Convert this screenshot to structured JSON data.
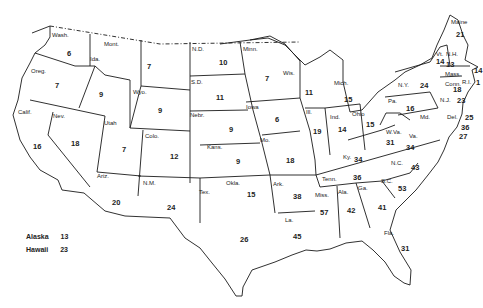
{
  "map": {
    "states": [
      {
        "abbr": "Wash.",
        "value": "6",
        "lx": 52,
        "ly": 32,
        "vx": 67,
        "vy": 50
      },
      {
        "abbr": "Oreg.",
        "value": "7",
        "lx": 31,
        "ly": 68,
        "vx": 55,
        "vy": 82
      },
      {
        "abbr": "Calif.",
        "value": "16",
        "lx": 18,
        "ly": 109,
        "vx": 33,
        "vy": 143
      },
      {
        "abbr": "Ida.",
        "value": "9",
        "lx": 90,
        "ly": 56,
        "vx": 99,
        "vy": 91
      },
      {
        "abbr": "Nev.",
        "value": "18",
        "lx": 53,
        "ly": 113,
        "vx": 71,
        "vy": 140
      },
      {
        "abbr": "Mont.",
        "value": "7",
        "lx": 104,
        "ly": 41,
        "vx": 147,
        "vy": 63
      },
      {
        "abbr": "Wyo.",
        "value": "9",
        "lx": 133,
        "ly": 89,
        "vx": 158,
        "vy": 107
      },
      {
        "abbr": "Utah",
        "value": "7",
        "lx": 104,
        "ly": 120,
        "vx": 122,
        "vy": 146
      },
      {
        "abbr": "Colo.",
        "value": "12",
        "lx": 145,
        "ly": 133,
        "vx": 170,
        "vy": 153
      },
      {
        "abbr": "Ariz.",
        "value": "20",
        "lx": 97,
        "ly": 173,
        "vx": 112,
        "vy": 199
      },
      {
        "abbr": "N.M.",
        "value": "24",
        "lx": 143,
        "ly": 180,
        "vx": 167,
        "vy": 204
      },
      {
        "abbr": "N.D.",
        "value": "10",
        "lx": 192,
        "ly": 46,
        "vx": 219,
        "vy": 59
      },
      {
        "abbr": "S.D.",
        "value": "11",
        "lx": 191,
        "ly": 79,
        "vx": 216,
        "vy": 94
      },
      {
        "abbr": "Nebr.",
        "value": "9",
        "lx": 190,
        "ly": 112,
        "vx": 229,
        "vy": 126
      },
      {
        "abbr": "Kans.",
        "value": "9",
        "lx": 207,
        "ly": 144,
        "vx": 236,
        "vy": 158
      },
      {
        "abbr": "Okla.",
        "value": "15",
        "lx": 226,
        "ly": 180,
        "vx": 247,
        "vy": 191
      },
      {
        "abbr": "Tex.",
        "value": "26",
        "lx": 199,
        "ly": 189,
        "vx": 240,
        "vy": 236
      },
      {
        "abbr": "Minn.",
        "value": "7",
        "lx": 243,
        "ly": 46,
        "vx": 265,
        "vy": 75
      },
      {
        "abbr": "Iowa",
        "value": "6",
        "lx": 246,
        "ly": 104,
        "vx": 275,
        "vy": 116
      },
      {
        "abbr": "Mo.",
        "value": "18",
        "lx": 260,
        "ly": 137,
        "vx": 286,
        "vy": 157
      },
      {
        "abbr": "Ark.",
        "value": "38",
        "lx": 273,
        "ly": 181,
        "vx": 293,
        "vy": 193
      },
      {
        "abbr": "La.",
        "value": "45",
        "lx": 285,
        "ly": 217,
        "vx": 293,
        "vy": 233
      },
      {
        "abbr": "Wis.",
        "value": "11",
        "lx": 283,
        "ly": 70,
        "vx": 305,
        "vy": 89
      },
      {
        "abbr": "Ill.",
        "value": "19",
        "lx": 306,
        "ly": 109,
        "vx": 313,
        "vy": 128
      },
      {
        "abbr": "Mich.",
        "value": "15",
        "lx": 334,
        "ly": 80,
        "vx": 344,
        "vy": 96
      },
      {
        "abbr": "Ind.",
        "value": "14",
        "lx": 330,
        "ly": 114,
        "vx": 338,
        "vy": 126
      },
      {
        "abbr": "Ohio",
        "value": "15",
        "lx": 352,
        "ly": 111,
        "vx": 366,
        "vy": 121
      },
      {
        "abbr": "Ky.",
        "value": "34",
        "lx": 343,
        "ly": 154,
        "vx": 354,
        "vy": 156
      },
      {
        "abbr": "Tenn.",
        "value": "36",
        "lx": 322,
        "ly": 176,
        "vx": 353,
        "vy": 174
      },
      {
        "abbr": "Miss.",
        "value": "57",
        "lx": 315,
        "ly": 192,
        "vx": 320,
        "vy": 209
      },
      {
        "abbr": "Ala.",
        "value": "42",
        "lx": 338,
        "ly": 189,
        "vx": 347,
        "vy": 207
      },
      {
        "abbr": "Ga.",
        "value": "41",
        "lx": 358,
        "ly": 185,
        "vx": 378,
        "vy": 204
      },
      {
        "abbr": "Fla.",
        "value": "31",
        "lx": 384,
        "ly": 230,
        "vx": 401,
        "vy": 245
      },
      {
        "abbr": "S.C.",
        "value": "53",
        "lx": 381,
        "ly": 178,
        "vx": 398,
        "vy": 185
      },
      {
        "abbr": "N.C.",
        "value": "43",
        "lx": 391,
        "ly": 160,
        "vx": 411,
        "vy": 164
      },
      {
        "abbr": "W.Va.",
        "value": "31",
        "lx": 386,
        "ly": 129,
        "vx": 386,
        "vy": 139
      },
      {
        "abbr": "Va.",
        "value": "34",
        "lx": 409,
        "ly": 133,
        "vx": 406,
        "vy": 144
      },
      {
        "abbr": "Pa.",
        "value": "16",
        "lx": 388,
        "ly": 98,
        "vx": 406,
        "vy": 105
      },
      {
        "abbr": "N.Y.",
        "value": "24",
        "lx": 398,
        "ly": 82,
        "vx": 420,
        "vy": 82
      },
      {
        "abbr": "Vt.",
        "value": "14",
        "lx": 436,
        "ly": 51,
        "vx": 436,
        "vy": 58
      },
      {
        "abbr": "N.H.",
        "value": "13",
        "lx": 446,
        "ly": 51,
        "vx": 446,
        "vy": 61
      },
      {
        "abbr": "Maine",
        "value": "21",
        "lx": 451,
        "ly": 19,
        "vx": 456,
        "vy": 31
      },
      {
        "abbr": "Mass.",
        "value": "14",
        "lx": 445,
        "ly": 71,
        "vx": 474,
        "vy": 67
      },
      {
        "abbr": "R.I.",
        "value": "1",
        "lx": 462,
        "ly": 79,
        "vx": 476,
        "vy": 79
      },
      {
        "abbr": "Conn.",
        "value": "18",
        "lx": 445,
        "ly": 81,
        "vx": 453,
        "vy": 86
      },
      {
        "abbr": "N.J.",
        "value": "23",
        "lx": 440,
        "ly": 97,
        "vx": 457,
        "vy": 97
      },
      {
        "abbr": "Del.",
        "value": "25",
        "lx": 447,
        "ly": 114,
        "vx": 465,
        "vy": 114
      },
      {
        "abbr": "Md.",
        "value": "36",
        "lx": 420,
        "ly": 114,
        "vx": 461,
        "vy": 124
      },
      {
        "abbr": "D.C.",
        "value": "27",
        "lx": 0,
        "ly": 0,
        "vx": 459,
        "vy": 133
      }
    ]
  },
  "legend": {
    "items": [
      {
        "name": "Alaska",
        "value": "13"
      },
      {
        "name": "Hawaii",
        "value": "23"
      }
    ]
  }
}
